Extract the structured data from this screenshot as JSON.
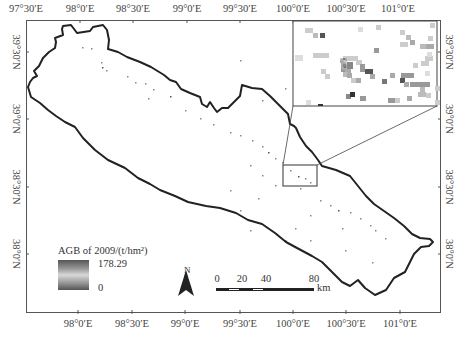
{
  "map": {
    "title": "AGB of 2009 study area map",
    "longitude_ticks_top": [
      "97°30′E",
      "98°0′E",
      "98°30′E",
      "99°0′E",
      "99°30′E",
      "100°0′E",
      "100°30′E",
      "101°0′E"
    ],
    "longitude_ticks_bottom": [
      "98°0′E",
      "98°30′E",
      "99°0′E",
      "99°30′E",
      "100°0′E",
      "100°30′E",
      "101°0′E"
    ],
    "latitude_ticks_left": [
      "39°30′N",
      "39°0′N",
      "38°30′N",
      "38°0′N"
    ],
    "latitude_ticks_right": [
      "39°30′N",
      "39°0′N",
      "38°30′N",
      "38°0′N"
    ],
    "boundary_color": "#222222",
    "frame_color": "#555555"
  },
  "legend": {
    "title": "AGB of 2009/(t/hm²)",
    "max_value": "178.29",
    "min_value": "0",
    "ramp_colors": [
      "#555555",
      "#9a9a9a",
      "#d8d8d8",
      "#9a9a9a",
      "#555555"
    ]
  },
  "north_arrow": {
    "label": "N"
  },
  "scale_bar": {
    "labels": [
      "0",
      "20",
      "40",
      "80"
    ],
    "unit": "km"
  },
  "inset": {
    "description": "Zoomed detail of AGB pixels near 100°0′E–100°15′E, 38°30′N–38°40′N"
  }
}
